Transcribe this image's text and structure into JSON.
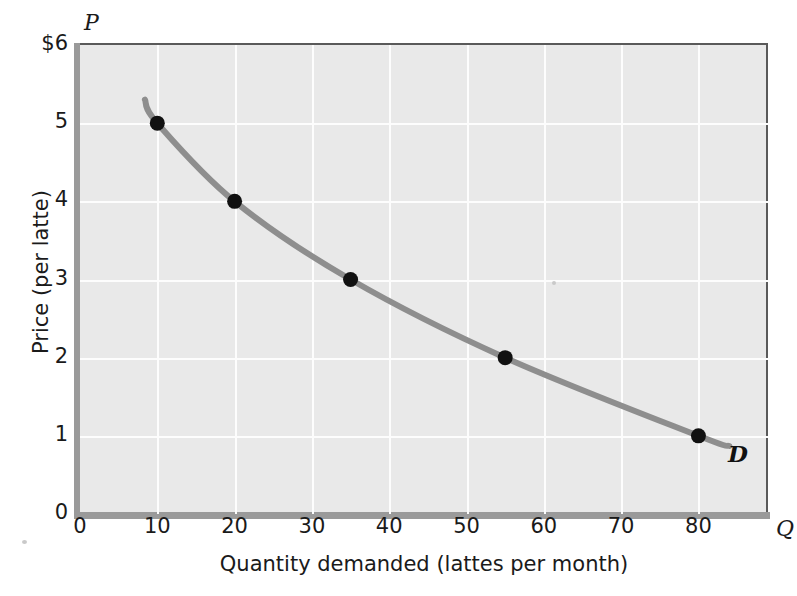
{
  "chart_data": {
    "type": "line",
    "title": "",
    "subtitle": "",
    "xlabel": "Quantity demanded (lattes per month)",
    "ylabel": "Price (per latte)",
    "x_symbol": "Q",
    "y_symbol": "P",
    "xlim": [
      0,
      89
    ],
    "ylim": [
      0,
      6
    ],
    "grid": true,
    "legend_position": "inline-curve-end",
    "x_ticks": [
      {
        "value": 0,
        "label": "0"
      },
      {
        "value": 10,
        "label": "10"
      },
      {
        "value": 20,
        "label": "20"
      },
      {
        "value": 30,
        "label": "30"
      },
      {
        "value": 40,
        "label": "40"
      },
      {
        "value": 50,
        "label": "50"
      },
      {
        "value": 60,
        "label": "60"
      },
      {
        "value": 70,
        "label": "70"
      },
      {
        "value": 80,
        "label": "80"
      }
    ],
    "y_ticks": [
      {
        "value": 0,
        "label": "0"
      },
      {
        "value": 1,
        "label": "1"
      },
      {
        "value": 2,
        "label": "2"
      },
      {
        "value": 3,
        "label": "3"
      },
      {
        "value": 4,
        "label": "4"
      },
      {
        "value": 5,
        "label": "5"
      },
      {
        "value": 6,
        "label": "$6"
      }
    ],
    "series": [
      {
        "name": "D",
        "label": "D",
        "type": "demand-curve",
        "color": "#8e8e8e",
        "marker_color": "#111111",
        "points": [
          {
            "x": 10,
            "y": 5
          },
          {
            "x": 20,
            "y": 4
          },
          {
            "x": 35,
            "y": 3
          },
          {
            "x": 55,
            "y": 2
          },
          {
            "x": 80,
            "y": 1
          }
        ],
        "curve_start": {
          "x": 8.4,
          "y": 5.3
        },
        "curve_end": {
          "x": 84,
          "y": 0.87
        }
      }
    ],
    "colors": {
      "plot_background": "#e9e9e9",
      "gridline": "#fdfdfd",
      "axis_bar": "#9a9a9a",
      "axis_border": "#5a5a5a",
      "curve": "#8e8e8e",
      "marker": "#111111",
      "text": "#1a1a1a"
    }
  }
}
